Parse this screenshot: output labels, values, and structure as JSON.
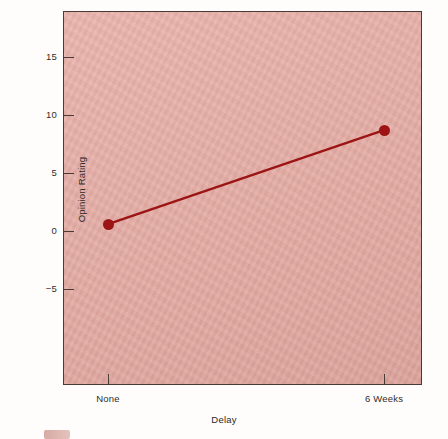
{
  "chart_data": {
    "type": "line",
    "title": "",
    "xlabel": "Delay",
    "ylabel": "Opinion Rating",
    "categories": [
      "None",
      "6 Weeks"
    ],
    "x": [
      0,
      1
    ],
    "values": [
      0.6,
      8.7
    ],
    "series": [
      {
        "name": "Opinion Rating",
        "values": [
          0.6,
          8.7
        ]
      }
    ],
    "ylim": [
      -8.5,
      17.5
    ],
    "yticks": [
      -5,
      0,
      5,
      10,
      15
    ],
    "ytick_labels": [
      "−5",
      "0",
      "5",
      "10",
      "15"
    ],
    "xtick_labels": [
      "None",
      "6 Weeks"
    ],
    "grid": false,
    "legend": "none",
    "marker": "filled-circle",
    "colors": {
      "line": "#9c1414",
      "marker": "#9c1414",
      "plot_background": "#e8aca4",
      "axis": "#4a3a36",
      "text": "#332c2a",
      "figure_background": "#fefdfb"
    }
  },
  "axes": {
    "y_title": "Opinion Rating",
    "x_title": "Delay",
    "y_ticks": [
      {
        "label": "15",
        "value": 15
      },
      {
        "label": "10",
        "value": 10
      },
      {
        "label": "5",
        "value": 5
      },
      {
        "label": "0",
        "value": 0
      },
      {
        "label": "−5",
        "value": -5
      }
    ],
    "x_ticks": [
      {
        "label": "None",
        "value": 0
      },
      {
        "label": "6 Weeks",
        "value": 1
      }
    ]
  }
}
